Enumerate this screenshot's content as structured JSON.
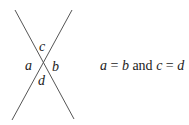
{
  "diagram": {
    "lines": [
      {
        "name": "line-1",
        "x1": 15,
        "y1": 10,
        "x2": 74,
        "y2": 119
      },
      {
        "name": "line-2",
        "x1": 72,
        "y1": 10,
        "x2": 12,
        "y2": 120
      }
    ],
    "line_color": "#555555",
    "angle_labels": {
      "top": "c",
      "left": "a",
      "right": "b",
      "bottom": "d"
    },
    "equation": {
      "var1": "a",
      "eq1": " = ",
      "var2": "b",
      "conj": " and ",
      "var3": "c",
      "eq2": " = ",
      "var4": "d"
    }
  }
}
